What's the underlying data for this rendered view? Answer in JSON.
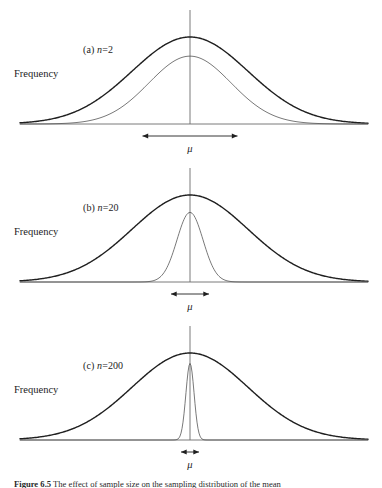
{
  "figure": {
    "caption": "Figure 6.5 The effect of sample size on the sampling distribution of the mean",
    "caption_label": "Figure 6.5",
    "caption_text": "The effect of sample size on the sampling distribution of the mean",
    "axis_label_y": "Frequency",
    "mu_symbol": "μ",
    "stroke_color": "#1f1f1f",
    "inner_stroke_color": "#555555",
    "axis_color": "#6b6b6b",
    "background": "#ffffff"
  },
  "panels": [
    {
      "id": "panel-a",
      "label_prefix": "(a)",
      "label_var": "n",
      "label_eq": "=",
      "label_value": "2",
      "label_full": "(a) n = 2",
      "sample_size": 2,
      "y_axis_label": "Frequency",
      "mu_label": "μ",
      "arrow_width_px": 95,
      "inner_curve_relative_width": 0.71,
      "inner_curve_relative_height": 0.78
    },
    {
      "id": "panel-b",
      "label_prefix": "(b)",
      "label_var": "n",
      "label_eq": "=",
      "label_value": "20",
      "label_full": "(b) n = 20",
      "sample_size": 20,
      "y_axis_label": "Frequency",
      "mu_label": "μ",
      "arrow_width_px": 38,
      "inner_curve_relative_width": 0.22,
      "inner_curve_relative_height": 0.8
    },
    {
      "id": "panel-c",
      "label_prefix": "(c)",
      "label_var": "n",
      "label_eq": "=",
      "label_value": "200",
      "label_full": "(c) n = 200",
      "sample_size": 200,
      "y_axis_label": "Frequency",
      "mu_label": "μ",
      "arrow_width_px": 18,
      "inner_curve_relative_width": 0.075,
      "inner_curve_relative_height": 0.88
    }
  ],
  "chart_data": {
    "type": "line",
    "title": "Figure 6.5 The effect of sample size on the sampling distribution of the mean",
    "xlabel": "",
    "ylabel": "Frequency",
    "grid": false,
    "legend": "none",
    "axis_center_x": 190,
    "annotations": [
      "(a) n = 2",
      "(b) n = 20",
      "(c) n = 200",
      "μ"
    ],
    "panels": [
      {
        "name": "(a) n = 2",
        "sample_size": 2,
        "series": [
          {
            "name": "population distribution",
            "kind": "normal",
            "mean": 0,
            "sigma": 1.0,
            "peak_height": 1.0,
            "stroke_width": 1.4
          },
          {
            "name": "sampling distribution of the mean",
            "kind": "normal",
            "mean": 0,
            "sigma": 0.707,
            "peak_height": 0.78,
            "stroke_width": 0.8
          }
        ],
        "mu_arrow_span": 95
      },
      {
        "name": "(b) n = 20",
        "sample_size": 20,
        "series": [
          {
            "name": "population distribution",
            "kind": "normal",
            "mean": 0,
            "sigma": 1.0,
            "peak_height": 1.0,
            "stroke_width": 1.4
          },
          {
            "name": "sampling distribution of the mean",
            "kind": "normal",
            "mean": 0,
            "sigma": 0.224,
            "peak_height": 0.8,
            "stroke_width": 0.8
          }
        ],
        "mu_arrow_span": 38
      },
      {
        "name": "(c) n = 200",
        "sample_size": 200,
        "series": [
          {
            "name": "population distribution",
            "kind": "normal",
            "mean": 0,
            "sigma": 1.0,
            "peak_height": 1.0,
            "stroke_width": 1.4
          },
          {
            "name": "sampling distribution of the mean",
            "kind": "normal",
            "mean": 0,
            "sigma": 0.0707,
            "peak_height": 0.88,
            "stroke_width": 0.8
          }
        ],
        "mu_arrow_span": 18
      }
    ]
  }
}
